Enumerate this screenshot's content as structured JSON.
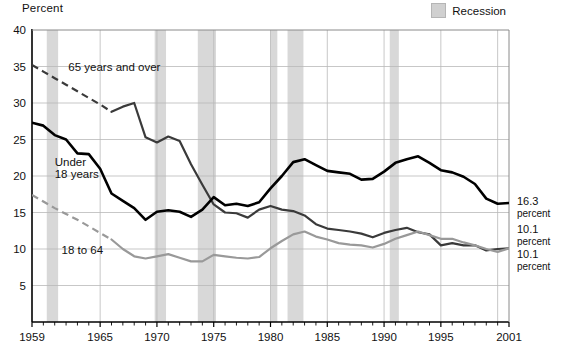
{
  "figure": {
    "y_axis_title": "Percent",
    "legend": {
      "recession_label": "Recession",
      "swatch_color": "#d0d0d0"
    }
  },
  "chart_data": {
    "type": "line",
    "title": "",
    "xlabel": "",
    "ylabel": "Percent",
    "xlim": [
      1959,
      2001
    ],
    "ylim": [
      0,
      40
    ],
    "ytick_labels": [
      "5",
      "10",
      "15",
      "20",
      "25",
      "30",
      "35",
      "40"
    ],
    "yticks": [
      5,
      10,
      15,
      20,
      25,
      30,
      35,
      40
    ],
    "xtick_labels": [
      "1959",
      "1965",
      "1970",
      "1975",
      "1980",
      "1985",
      "1990",
      "1995",
      "2001"
    ],
    "xticks": [
      1959,
      1965,
      1970,
      1975,
      1980,
      1985,
      1990,
      1995,
      2001
    ],
    "grid": true,
    "legend_position": "top-right",
    "annotations": [
      {
        "name": "label-65-over",
        "text": "65 years and over",
        "x": 1962.2,
        "y": 35.0
      },
      {
        "name": "label-under-18",
        "text": "Under",
        "x": 1961.0,
        "y": 21.9
      },
      {
        "name": "label-under-18-line2",
        "text": "18 years",
        "x": 1961.0,
        "y": 20.3
      },
      {
        "name": "label-18-to-64",
        "text": "18 to 64",
        "x": 1961.6,
        "y": 9.9
      }
    ],
    "end_labels": [
      {
        "name": "end-label-under-18",
        "value": "16.3",
        "unit": "percent",
        "y": 16.3
      },
      {
        "name": "end-label-65-over",
        "value": "10.1",
        "unit": "percent",
        "y": 12.4
      },
      {
        "name": "end-label-18-to-64",
        "value": "10.1",
        "unit": "percent",
        "y": 9.0
      }
    ],
    "recession_bands": [
      {
        "start": 1960.3,
        "end": 1961.3
      },
      {
        "start": 1969.8,
        "end": 1970.8
      },
      {
        "start": 1973.6,
        "end": 1975.2
      },
      {
        "start": 1980.0,
        "end": 1980.6
      },
      {
        "start": 1981.5,
        "end": 1982.9
      },
      {
        "start": 1990.5,
        "end": 1991.3
      },
      {
        "start": 2001.0,
        "end": 2001.8
      }
    ],
    "series": [
      {
        "name": "65 years and over",
        "color": "#3a3a3a",
        "dashed_until": 1966,
        "x": [
          1959,
          1960,
          1961,
          1962,
          1963,
          1964,
          1965,
          1966,
          1967,
          1968,
          1969,
          1970,
          1971,
          1972,
          1973,
          1974,
          1975,
          1976,
          1977,
          1978,
          1979,
          1980,
          1981,
          1982,
          1983,
          1984,
          1985,
          1986,
          1987,
          1988,
          1989,
          1990,
          1991,
          1992,
          1993,
          1994,
          1995,
          1996,
          1997,
          1998,
          1999,
          2000,
          2001
        ],
        "values": [
          35.2,
          34.3,
          33.4,
          32.5,
          31.6,
          30.7,
          29.8,
          28.8,
          29.5,
          30.0,
          25.3,
          24.6,
          25.4,
          24.8,
          21.6,
          18.8,
          16.1,
          15.0,
          14.9,
          14.3,
          15.4,
          15.9,
          15.4,
          15.2,
          14.6,
          13.4,
          12.8,
          12.6,
          12.4,
          12.1,
          11.6,
          12.2,
          12.6,
          12.9,
          12.3,
          12.0,
          10.5,
          10.8,
          10.5,
          10.5,
          9.8,
          10.0,
          10.1
        ]
      },
      {
        "name": "Under 18 years",
        "color": "#000000",
        "dashed_until": null,
        "x": [
          1959,
          1960,
          1961,
          1962,
          1963,
          1964,
          1965,
          1966,
          1967,
          1968,
          1969,
          1970,
          1971,
          1972,
          1973,
          1974,
          1975,
          1976,
          1977,
          1978,
          1979,
          1980,
          1981,
          1982,
          1983,
          1984,
          1985,
          1986,
          1987,
          1988,
          1989,
          1990,
          1991,
          1992,
          1993,
          1994,
          1995,
          1996,
          1997,
          1998,
          1999,
          2000,
          2001
        ],
        "values": [
          27.3,
          26.9,
          25.6,
          25.0,
          23.1,
          23.0,
          21.0,
          17.6,
          16.6,
          15.6,
          14.0,
          15.1,
          15.3,
          15.1,
          14.4,
          15.4,
          17.1,
          16.0,
          16.2,
          15.9,
          16.4,
          18.3,
          20.0,
          21.9,
          22.3,
          21.5,
          20.7,
          20.5,
          20.3,
          19.5,
          19.6,
          20.6,
          21.8,
          22.3,
          22.7,
          21.8,
          20.8,
          20.5,
          19.9,
          18.9,
          16.9,
          16.2,
          16.3
        ]
      },
      {
        "name": "18 to 64",
        "color": "#999999",
        "dashed_until": 1966,
        "x": [
          1959,
          1960,
          1961,
          1962,
          1963,
          1964,
          1965,
          1966,
          1967,
          1968,
          1969,
          1970,
          1971,
          1972,
          1973,
          1974,
          1975,
          1976,
          1977,
          1978,
          1979,
          1980,
          1981,
          1982,
          1983,
          1984,
          1985,
          1986,
          1987,
          1988,
          1989,
          1990,
          1991,
          1992,
          1993,
          1994,
          1995,
          1996,
          1997,
          1998,
          1999,
          2000,
          2001
        ],
        "values": [
          17.4,
          16.5,
          15.6,
          14.8,
          14.0,
          13.1,
          12.2,
          11.3,
          10.0,
          9.0,
          8.7,
          9.0,
          9.3,
          8.8,
          8.3,
          8.3,
          9.2,
          9.0,
          8.8,
          8.7,
          8.9,
          10.1,
          11.1,
          12.0,
          12.4,
          11.7,
          11.3,
          10.8,
          10.6,
          10.5,
          10.2,
          10.7,
          11.4,
          11.9,
          12.4,
          11.9,
          11.4,
          11.4,
          10.9,
          10.5,
          10.0,
          9.6,
          10.1
        ]
      }
    ]
  }
}
